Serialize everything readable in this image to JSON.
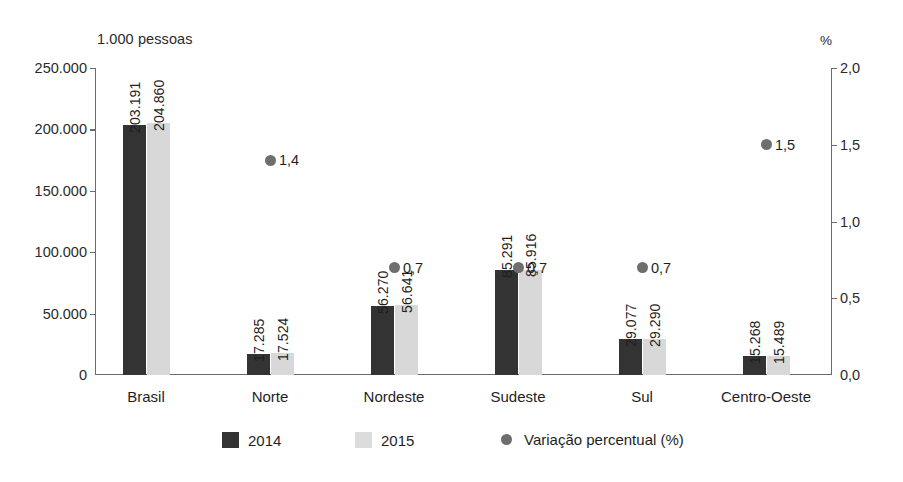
{
  "chart_data": {
    "type": "bar",
    "title": "",
    "left_axis_caption": "1.000 pessoas",
    "right_axis_caption": "%",
    "categories": [
      "Brasil",
      "Norte",
      "Nordeste",
      "Sudeste",
      "Sul",
      "Centro-Oeste"
    ],
    "series": [
      {
        "name": "2014",
        "color": "#333333",
        "values": [
          203191,
          17285,
          56270,
          85291,
          29077,
          15268
        ],
        "labels": [
          "203.191",
          "17.285",
          "56.270",
          "85.291",
          "29.077",
          "15.268"
        ]
      },
      {
        "name": "2015",
        "color": "#d8d8d8",
        "values": [
          204860,
          17524,
          56641,
          85916,
          29290,
          15489
        ],
        "labels": [
          "204.860",
          "17.524",
          "56.641",
          "85.916",
          "29.290",
          "15.489"
        ]
      }
    ],
    "variation_series": {
      "name": "Variação percentual (%)",
      "color": "#6e6e6e",
      "values": [
        null,
        1.4,
        0.7,
        0.7,
        0.7,
        1.5
      ],
      "labels": [
        "",
        "1,4",
        "0,7",
        "0,7",
        "0,7",
        "1,5"
      ]
    },
    "left_axis": {
      "ylim": [
        0,
        250000
      ],
      "ticks": [
        0,
        50000,
        100000,
        150000,
        200000,
        250000
      ],
      "tick_labels": [
        "0",
        "50.000",
        "100.000",
        "150.000",
        "200.000",
        "250.000"
      ]
    },
    "right_axis": {
      "ylim": [
        0,
        2.0
      ],
      "ticks": [
        0.0,
        0.5,
        1.0,
        1.5,
        2.0
      ],
      "tick_labels": [
        "0,0",
        "0,5",
        "1,0",
        "1,5",
        "2,0"
      ]
    },
    "grid": false,
    "legend_position": "bottom",
    "legend": [
      {
        "label": "2014",
        "marker": "square",
        "color": "#333333"
      },
      {
        "label": "2015",
        "marker": "square",
        "color": "#dcdcdc"
      },
      {
        "label": "Variação percentual (%)",
        "marker": "circle",
        "color": "#6e6e6e"
      }
    ]
  }
}
